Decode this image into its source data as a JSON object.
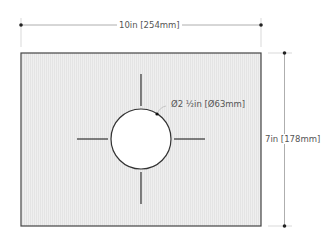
{
  "dimensions": {
    "width_label": "10in [254mm]",
    "height_label": "7in [178mm]",
    "hole_label": "Ø2 ½in [Ø63mm]"
  },
  "colors": {
    "panel_fill": "#ececec",
    "panel_stroke": "#444444",
    "dim_line": "#aaaaaa",
    "hole_fill": "#ffffff",
    "marks": "#333333"
  }
}
